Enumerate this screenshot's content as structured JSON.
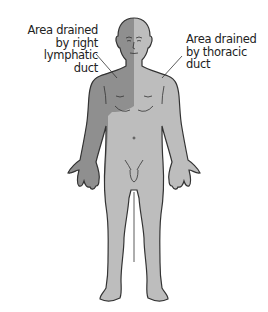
{
  "diagram": {
    "colors": {
      "right_lymphatic_region": "#8f8f8f",
      "thoracic_region": "#bdbdbd",
      "outline": "#333333",
      "background": "#ffffff"
    },
    "labels": {
      "right_lymphatic": {
        "lines": [
          "Area drained",
          "by right",
          "lymphatic",
          "duct"
        ]
      },
      "thoracic": {
        "lines": [
          "Area drained",
          "by thoracic",
          "duct"
        ]
      }
    }
  }
}
